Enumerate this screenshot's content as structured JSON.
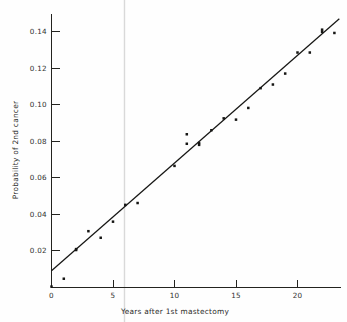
{
  "figure": {
    "background_color": "#fefefe",
    "ink_color": "#161614",
    "artifact_color": "#d9d9d9"
  },
  "axes": {
    "x_title": "Years after 1st mastectomy",
    "y_title": "Probability of 2nd cancer",
    "x_tick_labels": [
      "0",
      "5",
      "10",
      "15",
      "20"
    ],
    "y_tick_labels": [
      "0.02",
      "0.04",
      "0.06",
      "0.08",
      "0.10",
      "0.12",
      "0.14"
    ]
  },
  "chart_data": {
    "type": "scatter",
    "title": "",
    "subtitle": "",
    "xlabel": "Years after 1st mastectomy",
    "ylabel": "Probability of 2nd cancer",
    "xlim": [
      0,
      23.5
    ],
    "ylim": [
      0,
      0.1495
    ],
    "xticks": [
      0,
      5,
      10,
      15,
      20
    ],
    "yticks": [
      0.02,
      0.04,
      0.06,
      0.08,
      0.1,
      0.12,
      0.14
    ],
    "grid": false,
    "legend": null,
    "legend_position": "none",
    "series": [
      {
        "name": "Observed probability of 2nd cancer",
        "type": "scatter",
        "marker": "square-dot",
        "color": "#161614",
        "x": [
          0,
          1,
          2,
          2,
          3,
          4,
          5,
          6,
          7,
          10,
          11,
          11,
          12,
          12,
          13,
          14,
          15,
          16,
          17,
          18,
          19,
          20,
          21,
          22,
          22,
          23
        ],
        "y": [
          0.0005,
          0.0048,
          0.0205,
          0.021,
          0.0308,
          0.0272,
          0.036,
          0.0452,
          0.0462,
          0.0665,
          0.0786,
          0.0838,
          0.078,
          0.079,
          0.086,
          0.0925,
          0.0918,
          0.0982,
          0.109,
          0.111,
          0.117,
          0.1285,
          0.1285,
          0.1398,
          0.141,
          0.1392
        ]
      },
      {
        "name": "Fitted straight line",
        "type": "line",
        "color": "#161614",
        "x": [
          0,
          23.4
        ],
        "y": [
          0.0092,
          0.147
        ],
        "slope_per_year": 0.00589,
        "intercept": 0.0092
      }
    ],
    "annotations": [
      {
        "kind": "scan-artifact",
        "description": "faint vertical gray page-fold line",
        "x": 5.95
      }
    ]
  }
}
